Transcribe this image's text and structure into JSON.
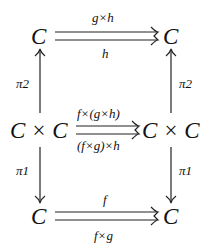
{
  "diagram": {
    "nodes": {
      "top_left": "C",
      "top_right": "C",
      "mid_left": "C × C",
      "mid_right": "C × C",
      "bottom_left": "C",
      "bottom_right": "C"
    },
    "edges": {
      "top_upper": "g×h",
      "top_lower": "h",
      "mid_upper": "f×(g×h)",
      "mid_lower": "(f×g)×h",
      "bottom_upper": "f",
      "bottom_lower": "f×g",
      "left_up": "π2",
      "right_up": "π2",
      "left_down": "π1",
      "right_down": "π1"
    }
  }
}
